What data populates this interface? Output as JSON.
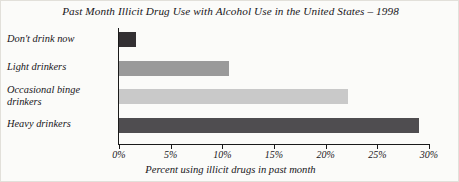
{
  "chart_data": {
    "type": "bar",
    "orientation": "horizontal",
    "title": "Past Month Illicit Drug Use with Alcohol Use in the United States – 1998",
    "xlabel": "Percent using illicit drugs in past month",
    "ylabel": "",
    "categories": [
      "Don't drink now",
      "Light drinkers",
      "Occasional binge drinkers",
      "Heavy drinkers"
    ],
    "values": [
      1.6,
      10.6,
      22.2,
      29.0
    ],
    "bar_colors": [
      "#333033",
      "#9a9a9a",
      "#c9c9c9",
      "#4f4d50"
    ],
    "xlim": [
      0,
      30
    ],
    "xticks": [
      0,
      5,
      10,
      15,
      20,
      25,
      30
    ],
    "xtick_labels": [
      "0%",
      "5%",
      "10%",
      "15%",
      "20%",
      "25%",
      "30%"
    ],
    "grid": false,
    "legend": "none"
  }
}
